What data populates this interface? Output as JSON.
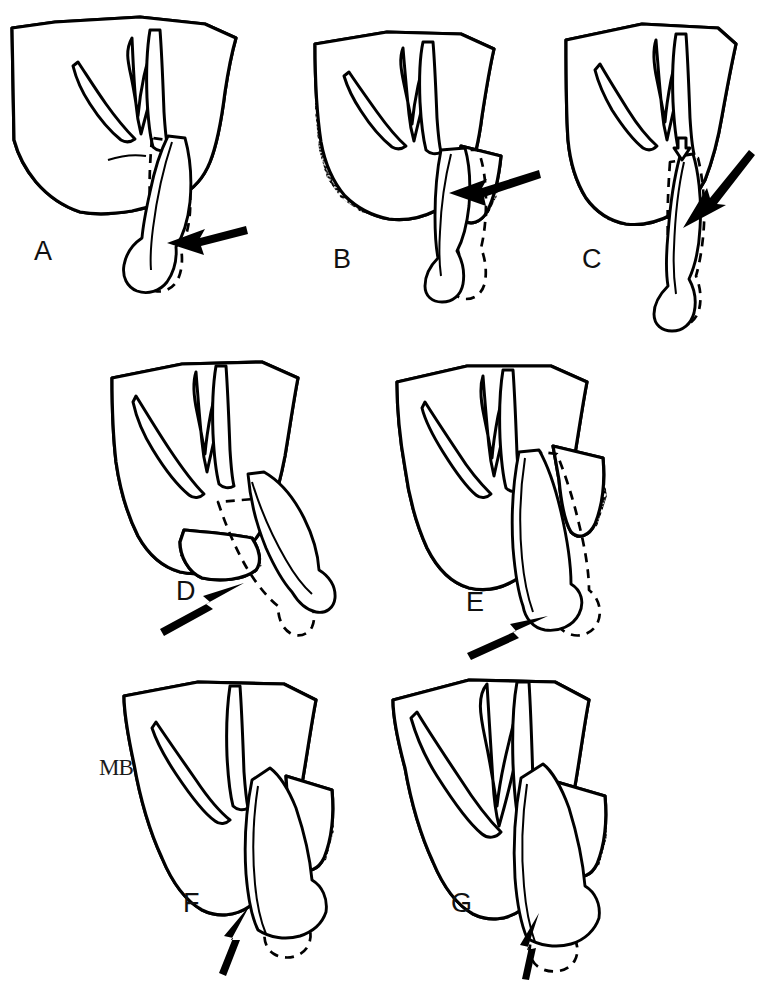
{
  "figure": {
    "type": "anatomical-line-drawing",
    "background_color": "#ffffff",
    "ink_color": "#000000",
    "panel_count": 7,
    "annotation": {
      "text": "MB",
      "meaning": "mandibular-body-annotation"
    },
    "panels": [
      {
        "id": "A",
        "label": "A",
        "row": 1,
        "column": 1,
        "label_x": 34,
        "label_y": 238,
        "arrow": {
          "name": "pointer-arrow-a",
          "direction": "left",
          "tail_x": 246,
          "tail_y": 228,
          "tip_x": 167,
          "tip_y": 243,
          "angle_deg": 180
        }
      },
      {
        "id": "B",
        "label": "B",
        "row": 1,
        "column": 2,
        "label_x": 333,
        "label_y": 246,
        "arrow": {
          "name": "pointer-arrow-b",
          "direction": "left",
          "tail_x": 539,
          "tail_y": 178,
          "tip_x": 449,
          "tip_y": 193,
          "angle_deg": 180
        }
      },
      {
        "id": "C",
        "label": "C",
        "row": 1,
        "column": 3,
        "label_x": 582,
        "label_y": 246,
        "arrow": {
          "name": "pointer-arrow-c",
          "direction": "down-left",
          "tail_x": 749,
          "tail_y": 150,
          "tip_x": 683,
          "tip_y": 228,
          "angle_deg": 230
        }
      },
      {
        "id": "D",
        "label": "D",
        "row": 2,
        "column": 1,
        "label_x": 176,
        "label_y": 578,
        "arrow": {
          "name": "pointer-arrow-d",
          "direction": "up-right",
          "tail_x": 179,
          "tail_y": 631,
          "tip_x": 244,
          "tip_y": 583,
          "angle_deg": 35
        }
      },
      {
        "id": "E",
        "label": "E",
        "row": 2,
        "column": 2,
        "label_x": 466,
        "label_y": 589,
        "arrow": {
          "name": "pointer-arrow-e",
          "direction": "up-right",
          "tail_x": 500,
          "tail_y": 645,
          "tip_x": 548,
          "tip_y": 616,
          "angle_deg": 32
        }
      },
      {
        "id": "F",
        "label": "F",
        "row": 3,
        "column": 1,
        "label_x": 183,
        "label_y": 890,
        "arrow": {
          "name": "pointer-arrow-f",
          "direction": "up-right",
          "tail_x": 226,
          "tail_y": 968,
          "tip_x": 249,
          "tip_y": 907,
          "angle_deg": 69
        }
      },
      {
        "id": "G",
        "label": "G",
        "row": 3,
        "column": 2,
        "label_x": 451,
        "label_y": 890,
        "arrow": {
          "name": "pointer-arrow-g",
          "direction": "up-right",
          "tail_x": 528,
          "tail_y": 972,
          "tip_x": 539,
          "tip_y": 913,
          "angle_deg": 79
        }
      }
    ]
  }
}
